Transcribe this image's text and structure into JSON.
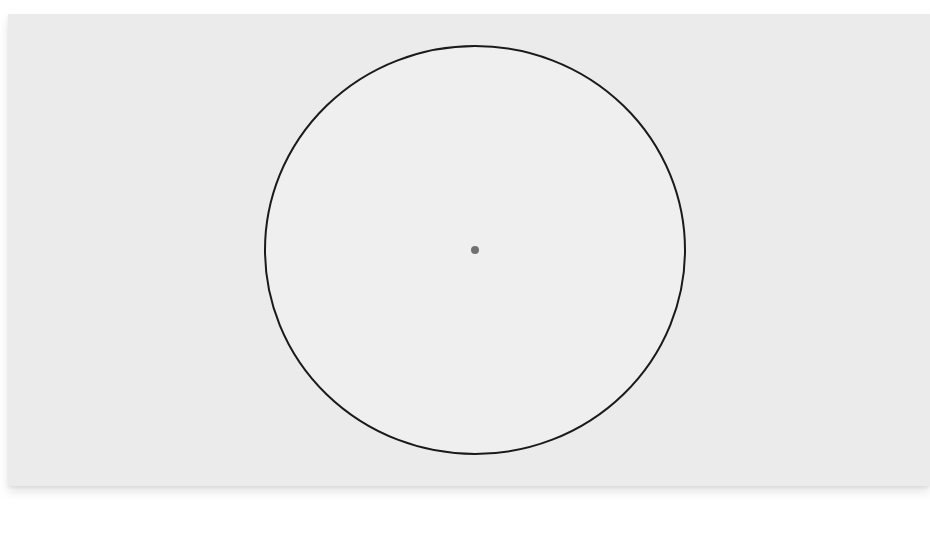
{
  "diagram": {
    "type": "circle-with-center-point",
    "colors": {
      "background": "#ebebeb",
      "circle_fill": "#efefef",
      "circle_stroke": "#1a1a1a",
      "center_point": "#707070"
    },
    "circle": {
      "cx": 475,
      "cy": 250,
      "rx": 210,
      "ry": 204,
      "stroke_width": 2
    },
    "center_point": {
      "cx": 475,
      "cy": 250,
      "r": 4
    }
  }
}
